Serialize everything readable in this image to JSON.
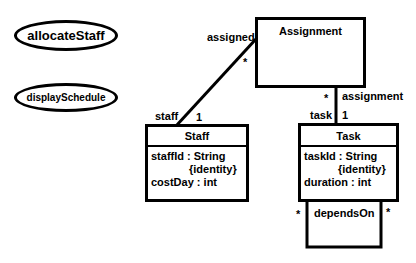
{
  "operations": [
    {
      "name": "allocateStaff"
    },
    {
      "name": "displaySchedule"
    }
  ],
  "classes": {
    "assignment": {
      "name": "Assignment",
      "attributes": []
    },
    "staff": {
      "name": "Staff",
      "attributes": [
        {
          "text": "staffId : String"
        },
        {
          "text": "{identity}"
        },
        {
          "text": "costDay : int"
        }
      ]
    },
    "task": {
      "name": "Task",
      "attributes": [
        {
          "text": "taskId : String"
        },
        {
          "text": "{identity}"
        },
        {
          "text": "duration : int"
        }
      ]
    }
  },
  "associations": {
    "staff_assignment": {
      "assignment_end_role": "assigned",
      "assignment_end_multiplicity": "*",
      "staff_end_role": "staff",
      "staff_end_multiplicity": "1"
    },
    "task_assignment": {
      "assignment_end_role": "assignment",
      "assignment_end_multiplicity": "*",
      "task_end_role": "task",
      "task_end_multiplicity": "1"
    },
    "task_self": {
      "name": "dependsOn",
      "left_multiplicity": "*",
      "right_multiplicity": "*"
    }
  }
}
